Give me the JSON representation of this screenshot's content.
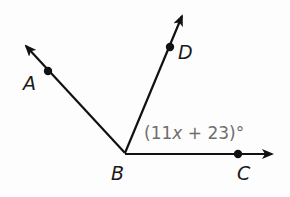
{
  "diagram": {
    "type": "angle-rays",
    "vertex": {
      "label": "B",
      "x": 125,
      "y": 153
    },
    "rays": [
      {
        "name": "ray-BA",
        "point_label": "A",
        "point": {
          "x": 48,
          "y": 71
        },
        "tip": {
          "x": 25,
          "y": 45
        },
        "label_pos": {
          "x": 24,
          "y": 90
        }
      },
      {
        "name": "ray-BD",
        "point_label": "D",
        "point": {
          "x": 170,
          "y": 47
        },
        "tip": {
          "x": 183,
          "y": 14
        },
        "label_pos": {
          "x": 178,
          "y": 59
        }
      },
      {
        "name": "ray-BC",
        "point_label": "C",
        "point": {
          "x": 238,
          "y": 154
        },
        "tip": {
          "x": 274,
          "y": 154
        },
        "label_pos": {
          "x": 237,
          "y": 180
        }
      }
    ],
    "vertex_label_pos": {
      "x": 111,
      "y": 180
    },
    "angle_label": {
      "text_open": "(11",
      "variable": "x",
      "text_close": " + 23)°",
      "full": "(11x + 23)°",
      "angle": "DBC",
      "x": 144,
      "y": 139
    },
    "colors": {
      "lines": "#111111",
      "labels": "#1a1a1a",
      "angle_label": "#6e6e6e",
      "background": "#fdfdfd"
    }
  }
}
